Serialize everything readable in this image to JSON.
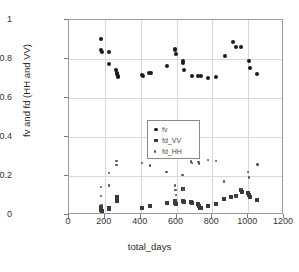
{
  "chart_data": {
    "type": "scatter",
    "title": "",
    "xlabel": "total_days",
    "ylabel": "fv and fd (HH and VV)",
    "xlim": [
      0,
      1200
    ],
    "ylim": [
      0,
      1
    ],
    "xticks": [
      0,
      200,
      400,
      600,
      800,
      1000,
      1200
    ],
    "yticks": [
      0,
      0.2,
      0.4,
      0.6,
      0.8,
      1
    ],
    "xtick_labels": [
      "0",
      "200",
      "400",
      "600",
      "800",
      "1000",
      "1200"
    ],
    "ytick_labels": [
      "0",
      "0.2",
      "0.4",
      "0.6",
      "0.8",
      "1"
    ],
    "grid": true,
    "legend_position": "center-left",
    "series": [
      {
        "name": "fv",
        "marker": "circle",
        "color": "#1a1a1a",
        "points": [
          [
            178,
            0.902
          ],
          [
            180,
            0.845
          ],
          [
            182,
            0.838
          ],
          [
            222,
            0.837
          ],
          [
            224,
            0.772
          ],
          [
            262,
            0.745
          ],
          [
            268,
            0.729
          ],
          [
            270,
            0.722
          ],
          [
            271,
            0.707
          ],
          [
            272,
            0.712
          ],
          [
            408,
            0.716
          ],
          [
            412,
            0.712
          ],
          [
            448,
            0.729
          ],
          [
            456,
            0.727
          ],
          [
            545,
            0.763
          ],
          [
            592,
            0.852
          ],
          [
            594,
            0.845
          ],
          [
            596,
            0.828
          ],
          [
            636,
            0.789
          ],
          [
            638,
            0.781
          ],
          [
            642,
            0.745
          ],
          [
            684,
            0.711
          ],
          [
            722,
            0.714
          ],
          [
            734,
            0.712
          ],
          [
            776,
            0.703
          ],
          [
            822,
            0.707
          ],
          [
            868,
            0.815
          ],
          [
            918,
            0.887
          ],
          [
            932,
            0.862
          ],
          [
            962,
            0.861
          ],
          [
            1002,
            0.792
          ],
          [
            1008,
            0.752
          ],
          [
            1052,
            0.721
          ]
        ]
      },
      {
        "name": "fd_VV",
        "marker": "square",
        "color": "#3a3a3a",
        "points": [
          [
            178,
            0.042
          ],
          [
            180,
            0.028
          ],
          [
            182,
            0.022
          ],
          [
            222,
            0.035
          ],
          [
            224,
            0.031
          ],
          [
            266,
            0.093
          ],
          [
            267,
            0.085
          ],
          [
            268,
            0.078
          ],
          [
            269,
            0.072
          ],
          [
            408,
            0.037
          ],
          [
            452,
            0.045
          ],
          [
            545,
            0.062
          ],
          [
            592,
            0.073
          ],
          [
            594,
            0.063
          ],
          [
            596,
            0.058
          ],
          [
            634,
            0.131
          ],
          [
            638,
            0.072
          ],
          [
            642,
            0.065
          ],
          [
            682,
            0.068
          ],
          [
            686,
            0.062
          ],
          [
            722,
            0.057
          ],
          [
            726,
            0.048
          ],
          [
            732,
            0.038
          ],
          [
            736,
            0.036
          ],
          [
            776,
            0.046
          ],
          [
            822,
            0.058
          ],
          [
            866,
            0.082
          ],
          [
            902,
            0.094
          ],
          [
            932,
            0.098
          ],
          [
            960,
            0.128
          ],
          [
            964,
            0.118
          ],
          [
            1000,
            0.113
          ],
          [
            1004,
            0.102
          ],
          [
            1008,
            0.092
          ],
          [
            1052,
            0.077
          ]
        ]
      },
      {
        "name": "fd_HH",
        "marker": "dot",
        "color": "#555555",
        "points": [
          [
            178,
            0.143
          ],
          [
            180,
            0.098
          ],
          [
            182,
            0.052
          ],
          [
            184,
            0.046
          ],
          [
            222,
            0.214
          ],
          [
            224,
            0.152
          ],
          [
            264,
            0.276
          ],
          [
            266,
            0.258
          ],
          [
            408,
            0.266
          ],
          [
            452,
            0.253
          ],
          [
            545,
            0.222
          ],
          [
            592,
            0.152
          ],
          [
            594,
            0.128
          ],
          [
            596,
            0.103
          ],
          [
            634,
            0.204
          ],
          [
            638,
            0.131
          ],
          [
            682,
            0.274
          ],
          [
            686,
            0.268
          ],
          [
            722,
            0.271
          ],
          [
            726,
            0.264
          ],
          [
            776,
            0.281
          ],
          [
            822,
            0.277
          ],
          [
            866,
            0.172
          ],
          [
            932,
            0.093
          ],
          [
            960,
            0.132
          ],
          [
            1000,
            0.222
          ],
          [
            1004,
            0.192
          ],
          [
            1052,
            0.259
          ]
        ]
      }
    ]
  },
  "legend": {
    "entries": [
      {
        "label": "fv"
      },
      {
        "label": "fd_VV"
      },
      {
        "label": "fd_HH"
      }
    ]
  }
}
